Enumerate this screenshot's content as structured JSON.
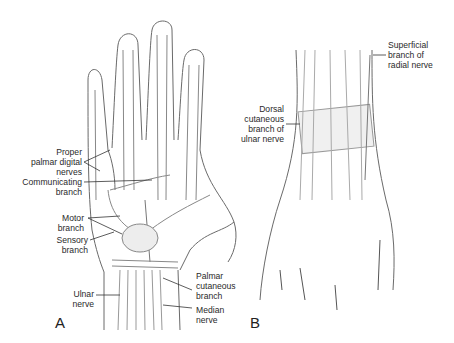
{
  "figure": {
    "panels": [
      {
        "id": "A",
        "letter": "A",
        "view": "palmar",
        "labels": {
          "proper_palmar_digital_nerves": "Proper\npalmar digital\nnerves",
          "communicating_branch": "Communicating\nbranch",
          "motor_branch": "Motor\nbranch",
          "sensory_branch": "Sensory\nbranch",
          "ulnar_nerve": "Ulnar\nnerve",
          "palmar_cutaneous_branch": "Palmar\ncutaneous\nbranch",
          "median_nerve": "Median\nnerve"
        }
      },
      {
        "id": "B",
        "letter": "B",
        "view": "dorsal",
        "labels": {
          "superficial_branch_radial": "Superficial\nbranch of\nradial nerve",
          "dorsal_cutaneous_ulnar": "Dorsal\ncutaneous\nbranch of\nulnar nerve"
        }
      }
    ],
    "colors": {
      "line": "#555555",
      "shade": "#e4e4e4",
      "text": "#2a2a2a"
    }
  }
}
